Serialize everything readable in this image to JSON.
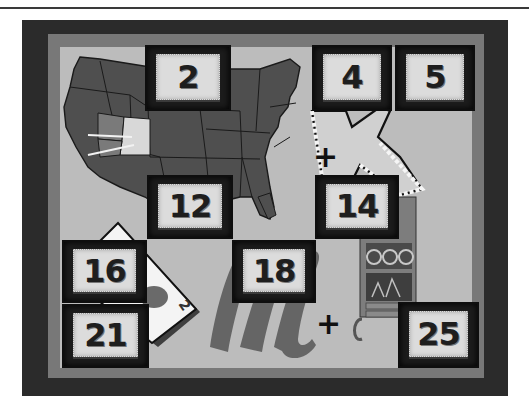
{
  "board": {
    "colors": {
      "page_background": "#ffffff",
      "outer_frame": "#2b2b2b",
      "border_band": "#787878",
      "board_surface": "#bcbcbc",
      "tile_frame": "#1c1c1c",
      "tile_face": "#dcdcdc",
      "tile_number": "#1e1e1e"
    },
    "tiles": [
      {
        "number": "2",
        "covers": "map-of-usa"
      },
      {
        "number": "4",
        "covers": "letter-k"
      },
      {
        "number": "5",
        "covers": "letter-k"
      },
      {
        "number": "12",
        "covers": "map-of-usa"
      },
      {
        "number": "14",
        "covers": "hutch-cabinet"
      },
      {
        "number": "16",
        "covers": "playing-card"
      },
      {
        "number": "18",
        "covers": "script-letter-m"
      },
      {
        "number": "21",
        "covers": "playing-card"
      },
      {
        "number": "25",
        "covers": "hutch-cabinet"
      }
    ],
    "operators": [
      {
        "symbol": "+",
        "position": "between-k-and-map"
      },
      {
        "symbol": "+",
        "position": "between-m-and-hutch"
      }
    ],
    "pictures": [
      {
        "name": "map-of-usa",
        "highlight": "Nevada/Utah region with rays"
      },
      {
        "name": "letter-k"
      },
      {
        "name": "playing-card",
        "rank": "2",
        "suit": "spade"
      },
      {
        "name": "script-letter-m"
      },
      {
        "name": "hutch-cabinet",
        "contents": "plates and teapot"
      }
    ]
  }
}
